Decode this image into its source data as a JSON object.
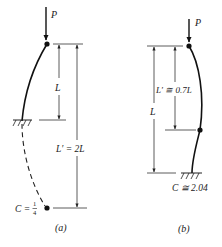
{
  "diagram_a": {
    "load_label": "P",
    "dim_short_label": "L",
    "dim_long_label": "L′ = 2L",
    "coeff_prefix": "C = ",
    "coeff_num": "1",
    "coeff_den": "4",
    "caption": "(a)",
    "support_type": "fixed base, free top",
    "coefficient_value": 0.25
  },
  "diagram_b": {
    "load_label": "P",
    "dim_short_label": "L′ ≅ 0.7L",
    "dim_long_label": "L",
    "coeff_label": "C ≅ 2.04",
    "caption": "(b)",
    "support_type": "fixed base, pinned top",
    "coefficient_value": 2.04
  }
}
